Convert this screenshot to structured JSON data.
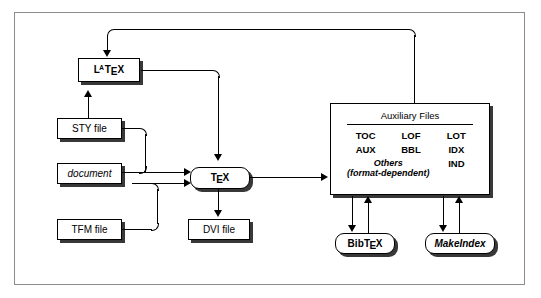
{
  "diagram": {
    "nodes": {
      "latex": {
        "label": "LaTeX",
        "parts": {
          "l": "L",
          "a": "A",
          "t": "T",
          "e": "E",
          "x": "X"
        }
      },
      "sty": {
        "label": "STY file"
      },
      "document": {
        "label": "document"
      },
      "tfm": {
        "label": "TFM file"
      },
      "tex": {
        "label": "TeX",
        "parts": {
          "t": "T",
          "e": "E",
          "x": "X"
        }
      },
      "dvi": {
        "label": "DVI file"
      },
      "bibtex": {
        "label": "BibTeX",
        "parts": {
          "bib": "Bib",
          "t": "T",
          "e": "E",
          "x": "X"
        }
      },
      "makeindex": {
        "label": "MakeIndex"
      }
    },
    "aux_panel": {
      "title": "Auxiliary Files",
      "extensions": [
        "TOC",
        "LOF",
        "LOT",
        "AUX",
        "BBL",
        "IDX"
      ],
      "others_line1": "Others",
      "others_line2": "(format-dependent)",
      "ind": "IND"
    },
    "colors": {
      "line": "#000000",
      "node_fill": "#ffffff",
      "frame_border": "#8c8c8c",
      "shadow": "rgba(0,0,0,0.78)"
    }
  }
}
